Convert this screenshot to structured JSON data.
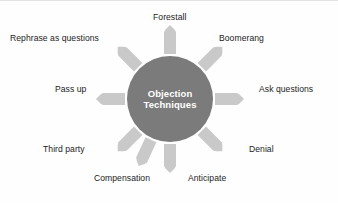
{
  "diagram": {
    "type": "hub-and-spoke-sunburst",
    "hub": {
      "line1": "Objection",
      "line2": "Techniques",
      "fill_color": "#7b7b7b",
      "text_color": "#ffffff",
      "center_x": 170,
      "center_y": 98,
      "radius": 43
    },
    "ray": {
      "fill_color": "#c9c9c9",
      "count": 8,
      "shape": "tapered-arrow"
    },
    "background_color": "#fefefe",
    "label_color": "#1c1c1c",
    "spokes": [
      {
        "label": "Forestall",
        "angle_deg": 90,
        "position": "top"
      },
      {
        "label": "Boomerang",
        "angle_deg": 45,
        "position": "top-right"
      },
      {
        "label": "Ask questions",
        "angle_deg": 0,
        "position": "right"
      },
      {
        "label": "Denial",
        "angle_deg": -45,
        "position": "bottom-right"
      },
      {
        "label": "Anticipate",
        "angle_deg": -90,
        "position": "bottom-right-lower"
      },
      {
        "label": "Compensation",
        "angle_deg": -90,
        "position": "bottom-left-lower"
      },
      {
        "label": "Third party",
        "angle_deg": 225,
        "position": "bottom-left"
      },
      {
        "label": "Pass up",
        "angle_deg": 180,
        "position": "left"
      },
      {
        "label": "Rephrase as questions",
        "angle_deg": 135,
        "position": "top-left"
      }
    ]
  }
}
